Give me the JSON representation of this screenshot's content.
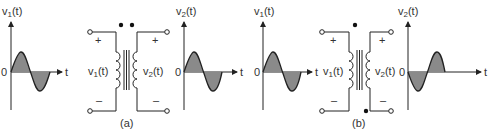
{
  "panels": [
    {
      "id": "a",
      "caption": "(a)",
      "dots": "same-side (both top)",
      "input_plot": {
        "ylabel": "v",
        "ylabel_sub": "1",
        "ylabel_suffix": "(t)",
        "origin": "0",
        "xlabel": "t",
        "phase": "normal"
      },
      "output_plot": {
        "ylabel": "v",
        "ylabel_sub": "2",
        "ylabel_suffix": "(t)",
        "origin": "0",
        "xlabel": "t",
        "phase": "normal"
      },
      "primary": {
        "label": "v",
        "sub": "1",
        "suffix": "(t)",
        "plus": "+",
        "minus": "–"
      },
      "secondary": {
        "label": "v",
        "sub": "2",
        "suffix": "(t)",
        "plus": "+",
        "minus": "–"
      }
    },
    {
      "id": "b",
      "caption": "(b)",
      "dots": "opposite (primary top, secondary bottom)",
      "input_plot": {
        "ylabel": "v",
        "ylabel_sub": "1",
        "ylabel_suffix": "(t)",
        "origin": "0",
        "xlabel": "t",
        "phase": "normal"
      },
      "output_plot": {
        "ylabel": "v",
        "ylabel_sub": "2",
        "ylabel_suffix": "(t)",
        "origin": "0",
        "xlabel": "t",
        "phase": "inverted"
      },
      "primary": {
        "label": "v",
        "sub": "1",
        "suffix": "(t)",
        "plus": "+",
        "minus": "–"
      },
      "secondary": {
        "label": "v",
        "sub": "2",
        "suffix": "(t)",
        "plus": "+",
        "minus": "–"
      }
    }
  ],
  "colors": {
    "line": "#222222",
    "fill": "#8a8a8a",
    "text": "#333333"
  }
}
